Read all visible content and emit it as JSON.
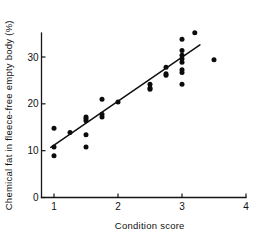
{
  "chart_data": {
    "type": "scatter",
    "title": "",
    "xlabel": "Condition score",
    "ylabel": "Chemical fat in fleece-free empty body (%)",
    "xlim": [
      0.55,
      4.0
    ],
    "ylim": [
      0,
      38
    ],
    "xticks": [
      1,
      2,
      3,
      4
    ],
    "xtick_labels": [
      "1",
      "2",
      "3",
      "4"
    ],
    "yticks": [
      0,
      10,
      20,
      30
    ],
    "ytick_labels": [
      "0",
      "10",
      "20",
      "30"
    ],
    "grid": false,
    "legend": null,
    "marker": "filled-circle",
    "points": [
      {
        "x": 1.0,
        "y": 14.8
      },
      {
        "x": 1.0,
        "y": 10.8
      },
      {
        "x": 1.0,
        "y": 8.9
      },
      {
        "x": 1.25,
        "y": 13.9
      },
      {
        "x": 1.5,
        "y": 17.2
      },
      {
        "x": 1.5,
        "y": 16.8
      },
      {
        "x": 1.5,
        "y": 16.4
      },
      {
        "x": 1.5,
        "y": 13.4
      },
      {
        "x": 1.5,
        "y": 10.8
      },
      {
        "x": 1.75,
        "y": 21.0
      },
      {
        "x": 1.75,
        "y": 17.8
      },
      {
        "x": 1.75,
        "y": 17.2
      },
      {
        "x": 2.0,
        "y": 20.4
      },
      {
        "x": 2.5,
        "y": 24.2
      },
      {
        "x": 2.5,
        "y": 23.4
      },
      {
        "x": 2.5,
        "y": 23.1
      },
      {
        "x": 2.75,
        "y": 27.8
      },
      {
        "x": 2.75,
        "y": 26.4
      },
      {
        "x": 2.75,
        "y": 26.1
      },
      {
        "x": 3.0,
        "y": 33.8
      },
      {
        "x": 3.0,
        "y": 31.4
      },
      {
        "x": 3.0,
        "y": 30.4
      },
      {
        "x": 3.0,
        "y": 29.6
      },
      {
        "x": 3.0,
        "y": 28.9
      },
      {
        "x": 3.0,
        "y": 27.3
      },
      {
        "x": 3.0,
        "y": 26.7
      },
      {
        "x": 3.0,
        "y": 24.2
      },
      {
        "x": 3.2,
        "y": 35.2
      },
      {
        "x": 3.5,
        "y": 29.4
      }
    ],
    "fit_line": {
      "x_start": 0.95,
      "y_start": 10.7,
      "x_end": 3.28,
      "y_end": 32.6
    }
  }
}
